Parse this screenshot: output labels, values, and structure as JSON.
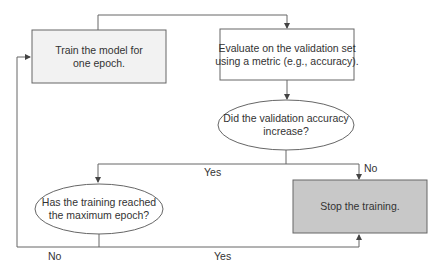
{
  "diagram": {
    "type": "flowchart",
    "colors": {
      "line": "#555555",
      "train_fill": "#f2f2f2",
      "evaluate_fill": "#ffffff",
      "stop_fill": "#c8c8c8",
      "ellipse_fill": "#ffffff",
      "text": "#333333"
    },
    "nodes": {
      "train": {
        "line1": "Train the model for",
        "line2": "one epoch."
      },
      "evaluate": {
        "line1": "Evaluate on the validation set",
        "line2": "using a metric (e.g., accuracy)."
      },
      "accuracy_decision": {
        "line1": "Did the validation accuracy",
        "line2": "increase?"
      },
      "max_epoch_decision": {
        "line1": "Has the training reached",
        "line2": "the maximum epoch?"
      },
      "stop": {
        "line1": "Stop the training."
      }
    },
    "edges": {
      "accuracy_yes": "Yes",
      "accuracy_no": "No",
      "max_epoch_no": "No",
      "max_epoch_yes": "Yes"
    }
  }
}
